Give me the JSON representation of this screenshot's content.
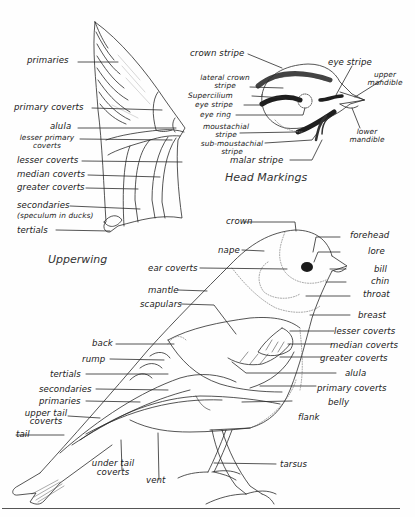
{
  "figures": {
    "upperwing": {
      "title": "Upperwing",
      "labels": {
        "primaries": "primaries",
        "primary_coverts": "primary coverts",
        "alula": "alula",
        "lesser_primary_coverts_1": "lesser primary",
        "lesser_primary_coverts_2": "coverts",
        "lesser_coverts": "lesser coverts",
        "median_coverts": "median coverts",
        "greater_coverts": "greater coverts",
        "secondaries": "secondaries",
        "speculum_note": "(speculum in ducks)",
        "tertials": "tertials"
      }
    },
    "head_markings": {
      "title": "Head Markings",
      "labels": {
        "crown_stripe": "crown stripe",
        "lateral_crown_stripe_1": "lateral crown",
        "lateral_crown_stripe_2": "stripe",
        "supercilium": "Supercilium",
        "eye_stripe_left": "eye stripe",
        "eye_ring": "eye ring",
        "moustachial_stripe_1": "moustachial",
        "moustachial_stripe_2": "stripe",
        "sub_moustachial_stripe_1": "sub-moustachial",
        "sub_moustachial_stripe_2": "stripe",
        "malar_stripe": "malar stripe",
        "eye_stripe_top": "eye stripe",
        "upper_mandible_1": "upper",
        "upper_mandible_2": "mandible",
        "lower_mandible_1": "lower",
        "lower_mandible_2": "mandible"
      }
    },
    "whole_bird": {
      "labels": {
        "crown": "crown",
        "nape": "nape",
        "ear_coverts": "ear coverts",
        "mantle": "mantle",
        "scapulars": "scapulars",
        "back": "back",
        "rump": "rump",
        "tertials": "tertials",
        "secondaries": "secondaries",
        "primaries": "primaries",
        "upper_tail_coverts_1": "upper tail",
        "upper_tail_coverts_2": "coverts",
        "tail": "tail",
        "under_tail_coverts_1": "under tail",
        "under_tail_coverts_2": "coverts",
        "vent": "vent",
        "forehead": "forehead",
        "lore": "lore",
        "bill": "bill",
        "chin": "chin",
        "throat": "throat",
        "breast": "breast",
        "lesser_coverts": "lesser coverts",
        "median_coverts": "median coverts",
        "greater_coverts": "greater coverts",
        "alula": "alula",
        "primary_coverts": "primary coverts",
        "belly": "belly",
        "flank": "flank",
        "tarsus": "tarsus"
      }
    }
  },
  "colors": {
    "ink": "#2a2a2a",
    "background": "#fefefe",
    "eye": "#1a1a1a"
  }
}
